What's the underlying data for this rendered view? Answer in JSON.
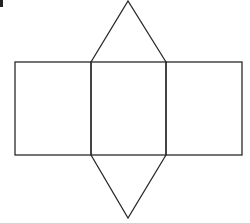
{
  "diagram": {
    "stroke_color": "#2a2a2a",
    "rectangles": [
      {
        "name": "left-face",
        "x": 15,
        "y": 62,
        "w": 76,
        "h": 93
      },
      {
        "name": "middle-face",
        "x": 91,
        "y": 62,
        "w": 75,
        "h": 93
      },
      {
        "name": "right-face",
        "x": 166,
        "y": 62,
        "w": 76,
        "h": 93
      }
    ],
    "triangles": [
      {
        "name": "top-face",
        "points": "91,62 128,1 166,62"
      },
      {
        "name": "bottom-face",
        "points": "91,155 128,218 166,155"
      }
    ]
  }
}
